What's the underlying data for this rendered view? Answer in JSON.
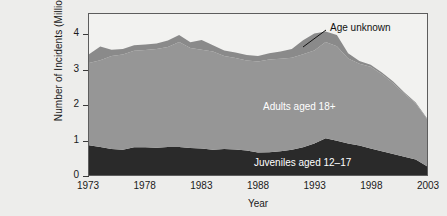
{
  "chart_data": {
    "type": "area",
    "stacked": true,
    "title": "",
    "xlabel": "Year",
    "ylabel": "Number of Incidents (Millions)",
    "xlim": [
      1973,
      2003
    ],
    "ylim": [
      0,
      4.6
    ],
    "yticks": [
      0,
      1,
      2,
      3,
      4
    ],
    "xticks": [
      1973,
      1978,
      1983,
      1988,
      1993,
      1998,
      2003
    ],
    "grid": false,
    "legend_position": "inline-annotations",
    "x": [
      1973,
      1974,
      1975,
      1976,
      1977,
      1978,
      1979,
      1980,
      1981,
      1982,
      1983,
      1984,
      1985,
      1986,
      1987,
      1988,
      1989,
      1990,
      1991,
      1992,
      1993,
      1994,
      1995,
      1996,
      1997,
      1998,
      1999,
      2000,
      2001,
      2002,
      2003
    ],
    "series": [
      {
        "name": "Juveniles aged 12-17",
        "color": "#2a2a2a",
        "values": [
          0.85,
          0.8,
          0.74,
          0.72,
          0.79,
          0.79,
          0.78,
          0.8,
          0.8,
          0.77,
          0.76,
          0.72,
          0.74,
          0.73,
          0.7,
          0.64,
          0.65,
          0.68,
          0.72,
          0.79,
          0.9,
          1.05,
          0.98,
          0.9,
          0.84,
          0.76,
          0.68,
          0.6,
          0.52,
          0.44,
          0.25
        ]
      },
      {
        "name": "Adults aged 18+",
        "color": "#969696",
        "values": [
          2.35,
          2.48,
          2.66,
          2.72,
          2.76,
          2.78,
          2.82,
          2.86,
          3.0,
          2.86,
          2.82,
          2.81,
          2.66,
          2.61,
          2.57,
          2.6,
          2.65,
          2.64,
          2.63,
          2.66,
          2.66,
          2.75,
          2.7,
          2.43,
          2.34,
          2.33,
          2.2,
          2.02,
          1.8,
          1.6,
          1.35
        ]
      },
      {
        "name": "Age unknown",
        "color": "#8a8a8a",
        "values": [
          0.25,
          0.39,
          0.18,
          0.16,
          0.16,
          0.16,
          0.16,
          0.18,
          0.2,
          0.16,
          0.28,
          0.18,
          0.16,
          0.16,
          0.16,
          0.16,
          0.18,
          0.21,
          0.25,
          0.4,
          0.48,
          0.3,
          0.32,
          0.15,
          0.08,
          0.06,
          0.05,
          0.05,
          0.04,
          0.03,
          0.02
        ]
      }
    ],
    "totals": [
      3.45,
      3.67,
      3.58,
      3.6,
      3.71,
      3.73,
      3.76,
      3.84,
      4.0,
      3.79,
      3.86,
      3.71,
      3.56,
      3.5,
      3.43,
      3.4,
      3.48,
      3.53,
      3.6,
      3.85,
      4.04,
      4.1,
      4.0,
      3.48,
      3.26,
      3.15,
      2.93,
      2.67,
      2.36,
      2.07,
      1.62
    ]
  },
  "axes": {
    "ytick_labels": [
      "4",
      "3",
      "2",
      "1",
      "0"
    ],
    "xtick_labels": [
      "1973",
      "1978",
      "1983",
      "1988",
      "1993",
      "1998",
      "2003"
    ],
    "ylabel": "Number of Incidents (Millions)",
    "xlabel": "Year"
  },
  "annotations": {
    "age_unknown": "Age unknown",
    "adults": "Adults aged 18+",
    "juveniles": "Juveniles aged 12–17"
  },
  "colors": {
    "background": "#ededeb",
    "plot_background": "#f2f2f0",
    "frame": "#5d5d5d",
    "juveniles": "#2a2a2a",
    "adults": "#969696",
    "age_unknown": "#8a8a8a",
    "text": "#1a1a1a"
  }
}
